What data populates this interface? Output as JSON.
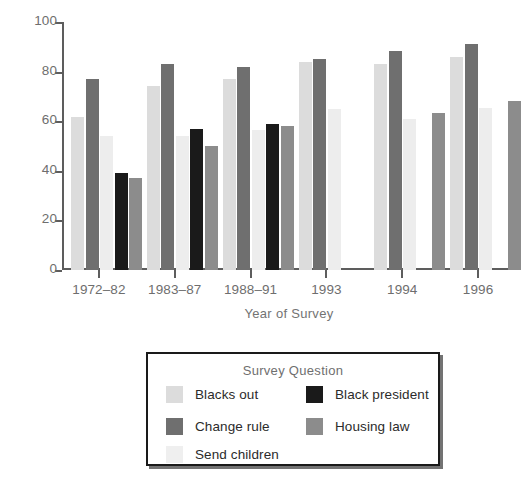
{
  "chart_data": {
    "type": "bar",
    "title": "",
    "xlabel": "Year of Survey",
    "ylabel": "Percentage More Favorable",
    "categories": [
      "1972–82",
      "1983–87",
      "1988–91",
      "1993",
      "1994",
      "1996"
    ],
    "ylim": [
      0,
      100
    ],
    "yticks": [
      0,
      20,
      40,
      60,
      80,
      100
    ],
    "ytick_labels": [
      "0",
      "20",
      "40",
      "60",
      "80",
      "100"
    ],
    "grid": false,
    "legend_position": "below-plot",
    "legend_title": "Survey Question",
    "series": [
      {
        "name": "Blacks out",
        "color": "#dcdcdc",
        "values": [
          61.5,
          74,
          77,
          84,
          83,
          86
        ]
      },
      {
        "name": "Change rule",
        "color": "#6f6f6f",
        "values": [
          77,
          83,
          82,
          85,
          88.5,
          91
        ]
      },
      {
        "name": "Send children",
        "color": "#ededed",
        "values": [
          54,
          54,
          56.5,
          65,
          61,
          65.5
        ]
      },
      {
        "name": "Black president",
        "color": "#1a1a1a",
        "values": [
          39,
          57,
          59,
          null,
          null,
          null
        ]
      },
      {
        "name": "Housing law",
        "color": "#8c8c8c",
        "values": [
          37,
          50,
          58,
          null,
          63.5,
          68
        ]
      }
    ]
  },
  "axes": {
    "y_title": "Percentage More Favorable",
    "x_title": "Year of Survey"
  },
  "legend": {
    "title": "Survey Question",
    "entries": [
      {
        "label": "Blacks out",
        "swatch": "#dcdcdc"
      },
      {
        "label": "Black president",
        "swatch": "#1a1a1a"
      },
      {
        "label": "Change rule",
        "swatch": "#6f6f6f"
      },
      {
        "label": "Housing law",
        "swatch": "#8c8c8c"
      },
      {
        "label": "Send children",
        "swatch": "#efefef"
      }
    ]
  },
  "colors": {
    "axis": "#5d5d5d",
    "tick_text": "#6e6e6e",
    "axis_title": "#737373",
    "legend_border": "#1a1a1a",
    "background": "#ffffff"
  }
}
